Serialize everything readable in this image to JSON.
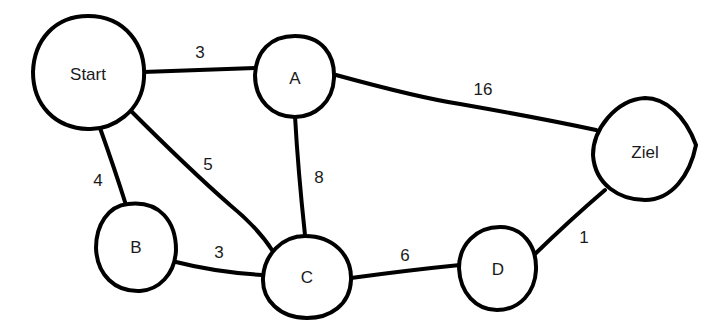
{
  "graph": {
    "nodes": [
      {
        "id": "start",
        "label": "Start"
      },
      {
        "id": "a",
        "label": "A"
      },
      {
        "id": "b",
        "label": "B"
      },
      {
        "id": "c",
        "label": "C"
      },
      {
        "id": "d",
        "label": "D"
      },
      {
        "id": "ziel",
        "label": "Ziel"
      }
    ],
    "edges": [
      {
        "from": "Start",
        "to": "A",
        "weight": "3"
      },
      {
        "from": "Start",
        "to": "B",
        "weight": "4"
      },
      {
        "from": "Start",
        "to": "C",
        "weight": "5"
      },
      {
        "from": "A",
        "to": "C",
        "weight": "8"
      },
      {
        "from": "A",
        "to": "Ziel",
        "weight": "16"
      },
      {
        "from": "B",
        "to": "C",
        "weight": "3"
      },
      {
        "from": "C",
        "to": "D",
        "weight": "6"
      },
      {
        "from": "D",
        "to": "Ziel",
        "weight": "1"
      }
    ],
    "colors": {
      "stroke": "#000000",
      "background": "#ffffff"
    }
  }
}
